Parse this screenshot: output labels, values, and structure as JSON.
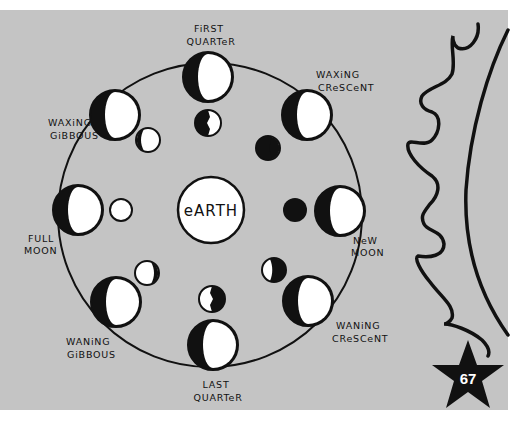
{
  "colors": {
    "panel": "#c4c4c4",
    "page": "#ffffff",
    "ink": "#111111",
    "light": "#ffffff"
  },
  "diagram": {
    "earth_label": "eARTH",
    "page_number": "67",
    "phases": [
      {
        "id": "first-quarter",
        "lines": [
          "FiRST",
          "QUARTeR"
        ]
      },
      {
        "id": "waxing-crescent",
        "lines": [
          "WAXiNG",
          "CReSCeNT"
        ]
      },
      {
        "id": "new-moon",
        "lines": [
          "NeW",
          "MOON"
        ]
      },
      {
        "id": "waning-crescent",
        "lines": [
          "WANiNG",
          "CReSCeNT"
        ]
      },
      {
        "id": "last-quarter",
        "lines": [
          "LAST",
          "QUARTeR"
        ]
      },
      {
        "id": "waning-gibbous",
        "lines": [
          "WANiNG",
          "GiBBOUS"
        ]
      },
      {
        "id": "full-moon",
        "lines": [
          "FULL",
          "MOON"
        ]
      },
      {
        "id": "waxing-gibbous",
        "lines": [
          "WAXiNG",
          "GiBBOUS"
        ]
      }
    ]
  }
}
